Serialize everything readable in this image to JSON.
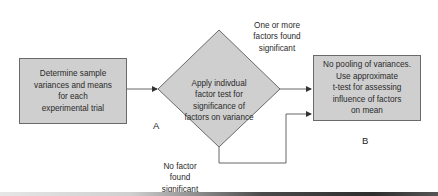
{
  "diagram": {
    "nodes": {
      "start_box": {
        "text": "Determine sample\nvariances and means\nfor each\nexperimental trial",
        "shape": "rectangle"
      },
      "decision": {
        "text": "Apply indivdual\nfactor test for\nsignificance of\nfactors on variance",
        "shape": "diamond"
      },
      "result_box": {
        "text": "No pooling of variances.\nUse approximate\nt-test for assessing\ninfluence of factors\non mean",
        "shape": "rectangle"
      }
    },
    "edge_labels": {
      "yes_branch": "One or more\nfactors found\nsignificant",
      "no_branch": "No factor\nfound\nsignificant"
    },
    "point_labels": {
      "a": "A",
      "b": "B"
    },
    "edges": [
      {
        "from": "start_box",
        "to": "decision"
      },
      {
        "from": "decision",
        "to": "result_box",
        "label": "One or more factors found significant"
      },
      {
        "from": "decision",
        "to": "result_box",
        "label": "No factor found significant"
      }
    ],
    "colors": {
      "fill": "#cfcfcf",
      "stroke": "#6a6a6a",
      "line": "#555555",
      "text": "#2a2a2a"
    }
  }
}
